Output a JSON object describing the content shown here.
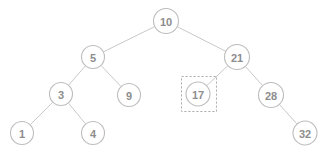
{
  "figure": {
    "width": 327,
    "height": 153,
    "background_color": "#ffffff",
    "node_stroke_color": "#bdbdbd",
    "node_fill_color": "#ffffff",
    "label_color": "#8d8d8d",
    "edge_color": "#c9c9c9",
    "highlight_stroke_color": "#b0b0b0"
  },
  "chart_data": {
    "type": "diagram",
    "subtype": "binary-search-tree",
    "title": "",
    "nodes": [
      {
        "id": "n10",
        "label": "10",
        "x": 166,
        "y": 21,
        "r": 12.5,
        "depth": 0,
        "highlighted": false
      },
      {
        "id": "n5",
        "label": "5",
        "x": 93,
        "y": 57,
        "r": 11.5,
        "depth": 1,
        "highlighted": false
      },
      {
        "id": "n21",
        "label": "21",
        "x": 237,
        "y": 57,
        "r": 12.5,
        "depth": 1,
        "highlighted": false
      },
      {
        "id": "n3",
        "label": "3",
        "x": 61,
        "y": 94,
        "r": 11.5,
        "depth": 2,
        "highlighted": false
      },
      {
        "id": "n9",
        "label": "9",
        "x": 129,
        "y": 95,
        "r": 11.5,
        "depth": 2,
        "highlighted": false
      },
      {
        "id": "n17",
        "label": "17",
        "x": 198,
        "y": 94,
        "r": 12.0,
        "depth": 2,
        "highlighted": true
      },
      {
        "id": "n28",
        "label": "28",
        "x": 271,
        "y": 95,
        "r": 12.5,
        "depth": 2,
        "highlighted": false
      },
      {
        "id": "n1",
        "label": "1",
        "x": 22,
        "y": 133,
        "r": 11.5,
        "depth": 3,
        "highlighted": false
      },
      {
        "id": "n4",
        "label": "4",
        "x": 93,
        "y": 133,
        "r": 11.5,
        "depth": 3,
        "highlighted": false
      },
      {
        "id": "n32",
        "label": "32",
        "x": 305,
        "y": 133,
        "r": 12.0,
        "depth": 3,
        "highlighted": false
      }
    ],
    "edges": [
      {
        "from": "n10",
        "to": "n5",
        "side": "left"
      },
      {
        "from": "n10",
        "to": "n21",
        "side": "right"
      },
      {
        "from": "n5",
        "to": "n3",
        "side": "left"
      },
      {
        "from": "n5",
        "to": "n9",
        "side": "right"
      },
      {
        "from": "n3",
        "to": "n1",
        "side": "left"
      },
      {
        "from": "n3",
        "to": "n4",
        "side": "right"
      },
      {
        "from": "n21",
        "to": "n17",
        "side": "left"
      },
      {
        "from": "n21",
        "to": "n28",
        "side": "right"
      },
      {
        "from": "n28",
        "to": "n32",
        "side": "right"
      }
    ],
    "highlight_box": {
      "target": "n17",
      "x": 181,
      "y": 76,
      "width": 35,
      "height": 35,
      "style": "dashed"
    },
    "annotations": []
  }
}
